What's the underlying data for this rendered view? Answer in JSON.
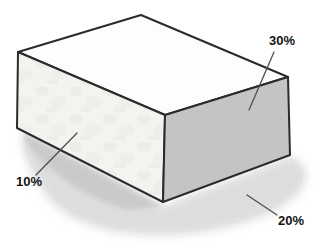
{
  "figure": {
    "labels": {
      "right_face": {
        "text": "30%"
      },
      "front_face": {
        "text": "10%"
      },
      "shadow": {
        "text": "20%"
      }
    },
    "colors": {
      "background": "#ffffff",
      "top_face": "#fdfdfd",
      "front_face": "#f3f3f0",
      "right_face": "#c4c4c4",
      "outline": "#2b2b2b",
      "leader_line": "#4f4f4f",
      "shadow_base": "#e0e0e0",
      "shadow_dark": "#c7c7c7",
      "label_text": "#141414"
    }
  }
}
